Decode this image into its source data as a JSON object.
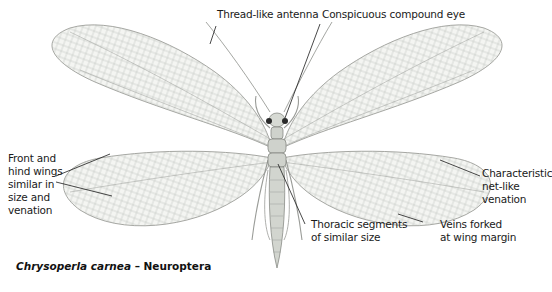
{
  "diagram": {
    "caption": {
      "species": "Chrysoperla carnea",
      "separator": " – ",
      "order": "Neuroptera"
    },
    "labels": {
      "antenna": "Thread-like antenna",
      "eye": "Conspicuous compound eye",
      "wings": [
        "Front and",
        "hind wings",
        "similar in",
        "size and",
        "venation"
      ],
      "venation": [
        "Characteristic",
        "net-like",
        "venation"
      ],
      "thorax": [
        "Thoracic segments",
        "of similar size"
      ],
      "veins": [
        "Veins forked",
        "at wing margin"
      ]
    },
    "colors": {
      "background": "#ffffff",
      "wing_fill": "#f4f5f2",
      "wing_vein": "#9a9c98",
      "body": "#cfd2cc",
      "body_stroke": "#7d807a",
      "eye": "#2b2b2b",
      "leader": "#1a1a1a"
    }
  }
}
